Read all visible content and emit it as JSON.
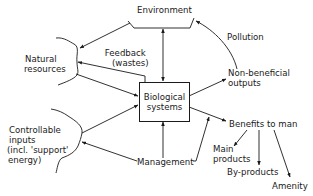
{
  "diagram": {
    "nodes": {
      "environment": {
        "label": "Environment"
      },
      "biological_systems": {
        "line1": "Biological",
        "line2": "systems"
      },
      "natural_resources": {
        "line1": "Natural",
        "line2": "resources"
      },
      "feedback": {
        "line1": "Feedback",
        "line2": "(wastes)"
      },
      "pollution": {
        "label": "Pollution"
      },
      "non_beneficial_outputs": {
        "line1": "Non-beneficial",
        "line2": "outputs"
      },
      "controllable_inputs": {
        "line1": "Controllable",
        "line2": "inputs",
        "line3": "(incl. 'support'",
        "line4": "energy)"
      },
      "management": {
        "label": "Management"
      },
      "benefits_to_man": {
        "label": "Benefits to man"
      },
      "main_products": {
        "line1": "Main",
        "line2": "products"
      },
      "by_products": {
        "label": "By-products"
      },
      "amenity": {
        "label": "Amenity"
      }
    },
    "edges": [
      {
        "from": "environment",
        "to": "natural_resources"
      },
      {
        "from": "environment",
        "to": "biological_systems",
        "bidirectional": true
      },
      {
        "from": "biological_systems",
        "to": "natural_resources",
        "label": "Feedback (wastes)"
      },
      {
        "from": "natural_resources",
        "to": "biological_systems"
      },
      {
        "from": "biological_systems",
        "to": "non_beneficial_outputs"
      },
      {
        "from": "non_beneficial_outputs",
        "to": "environment",
        "label": "Pollution"
      },
      {
        "from": "controllable_inputs",
        "to": "biological_systems"
      },
      {
        "from": "management",
        "to": "controllable_inputs"
      },
      {
        "from": "management",
        "to": "biological_systems"
      },
      {
        "from": "management",
        "to": "benefits_to_man"
      },
      {
        "from": "biological_systems",
        "to": "benefits_to_man"
      },
      {
        "from": "benefits_to_man",
        "to": "main_products"
      },
      {
        "from": "benefits_to_man",
        "to": "by_products"
      },
      {
        "from": "benefits_to_man",
        "to": "amenity"
      }
    ],
    "colors": {
      "ink": "#1a1a1a",
      "background": "#ffffff"
    }
  }
}
